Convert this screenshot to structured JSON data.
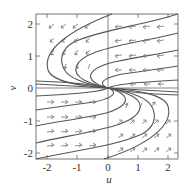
{
  "figure": {
    "type": "phase-portrait",
    "x_axis": {
      "label": "u",
      "ticks": [
        "-2",
        "-1",
        "0",
        "1",
        "2"
      ],
      "range": [
        -2.35,
        2.35
      ]
    },
    "y_axis": {
      "label": "v",
      "ticks": [
        "2",
        "1",
        "0",
        "-1",
        "-2"
      ],
      "range": [
        -2.2,
        2.25
      ]
    },
    "colors": {
      "trajectory": "#555555",
      "arrow": "#777777",
      "frame": "#666666",
      "text": "#333333"
    }
  }
}
